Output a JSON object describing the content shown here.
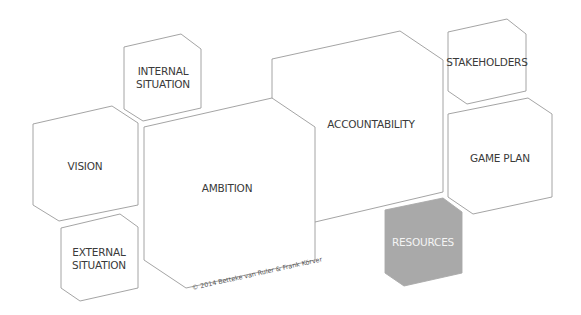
{
  "diagram": {
    "type": "hexagonal-block-model",
    "colors": {
      "stroke": "#9a9a9a",
      "text": "#3a3a3a",
      "highlight_fill": "#a9a9a9",
      "highlight_text": "#f4f4f4",
      "background": "#ffffff"
    },
    "blocks": {
      "internal_situation": "INTERNAL\nSITUATION",
      "vision": "VISION",
      "external_situation": "EXTERNAL\nSITUATION",
      "ambition": "AMBITION",
      "accountability": "ACCOUNTABILITY",
      "stakeholders": "STAKEHOLDERS",
      "game_plan": "GAME PLAN",
      "resources": "RESOURCES"
    },
    "highlighted_block": "RESOURCES",
    "copyright": "© 2014 Betteke van Ruler & Frank Körver"
  }
}
